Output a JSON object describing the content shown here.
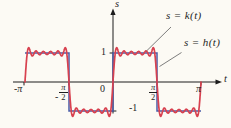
{
  "figure": {
    "background": "#fcfaf4",
    "axis": {
      "x_label": "t",
      "y_label": "s",
      "color": "#1c1c1c"
    },
    "x_ticks": [
      {
        "label": "-π"
      },
      {
        "prefix": "-",
        "num": "π",
        "den": "2"
      },
      {
        "label": "0"
      },
      {
        "num": "π",
        "den": "2"
      },
      {
        "label": "π"
      }
    ],
    "y_ticks": [
      {
        "label": "1"
      },
      {
        "label": "-1"
      }
    ],
    "annotations": [
      {
        "text": "s = k(t)",
        "points_to": "fourier-curve"
      },
      {
        "text": "s = h(t)",
        "points_to": "square-wave"
      }
    ],
    "leader_color": "#6e6e6e"
  },
  "chart_data": {
    "type": "line",
    "title": "",
    "xlabel": "t",
    "ylabel": "s",
    "xlim": [
      -3.46,
      3.9
    ],
    "ylim": [
      -1.59,
      2.52
    ],
    "x_tick_values": [
      -3.14159,
      -1.5708,
      0,
      1.5708,
      3.14159
    ],
    "x_tick_labels": [
      "-π",
      "-π/2",
      "0",
      "π/2",
      "π"
    ],
    "y_tick_values": [
      1,
      -1
    ],
    "grid": false,
    "legend_position": "annotated-with-leader-lines",
    "series": [
      {
        "name": "s = h(t)",
        "kind": "square-wave",
        "color": "#4a5ca8",
        "stroke_width": 1.5,
        "points": [
          [
            -3.14159,
            1
          ],
          [
            -1.5708,
            1
          ],
          [
            -1.5708,
            -1
          ],
          [
            0,
            -1
          ],
          [
            0,
            1
          ],
          [
            1.5708,
            1
          ],
          [
            1.5708,
            -1
          ],
          [
            3.14159,
            -1
          ]
        ]
      },
      {
        "name": "s = k(t)",
        "kind": "fourier-partial-sum",
        "color": "#d8414f",
        "stroke_width": 1.7,
        "formula": "(4/π)·Σ sin(2nt)/n",
        "fundamental": 2,
        "harmonics": [
          1,
          3,
          5,
          7,
          9,
          11
        ],
        "amplitude": 1.27324,
        "domain": [
          -3.14159,
          3.14159
        ]
      }
    ]
  }
}
